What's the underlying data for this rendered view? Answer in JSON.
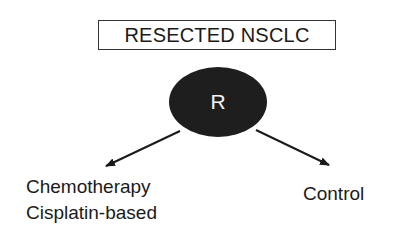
{
  "diagram": {
    "title": "RESECTED NSCLC",
    "randomization_node": {
      "label": "R",
      "fill": "#1e1e1e"
    },
    "arms": [
      {
        "line1": "Chemotherapy",
        "line2": "Cisplatin-based"
      },
      {
        "line1": "Control"
      }
    ],
    "colors": {
      "stroke": "#1a1a1a",
      "background": "#ffffff"
    }
  }
}
